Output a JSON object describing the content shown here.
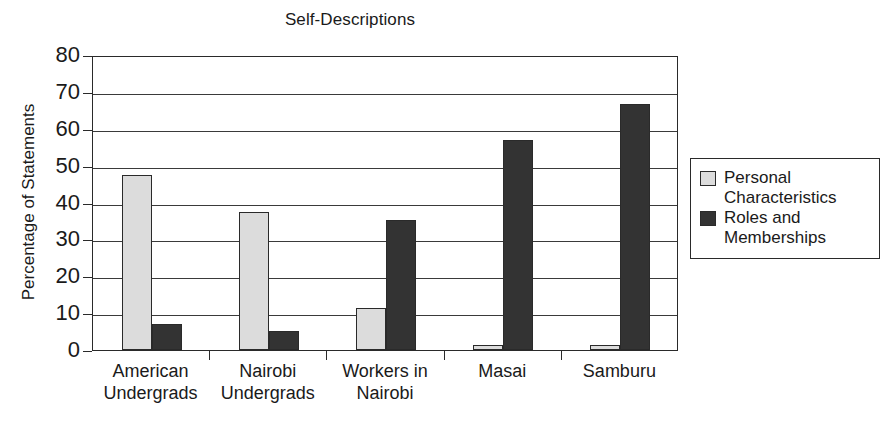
{
  "chart_data": {
    "type": "bar",
    "title": "Self-Descriptions",
    "xlabel": "",
    "ylabel": "Percentage of Statements",
    "ylim": [
      0,
      80
    ],
    "ytick_step": 10,
    "yticks": [
      80,
      70,
      60,
      50,
      40,
      30,
      20,
      10,
      0
    ],
    "grid": true,
    "legend_position": "right",
    "categories": [
      "American Undergrads",
      "Nairobi Undergrads",
      "Workers in Nairobi",
      "Masai",
      "Samburu"
    ],
    "category_lines": [
      [
        "American",
        "Undergrads"
      ],
      [
        "Nairobi",
        "Undergrads"
      ],
      [
        "Workers in",
        "Nairobi"
      ],
      [
        "Masai",
        ""
      ],
      [
        "Samburu",
        ""
      ]
    ],
    "series": [
      {
        "name": "Personal Characteristics",
        "color": "#dcdcdc",
        "values": [
          47.5,
          37.3,
          11.5,
          1.3,
          0.6
        ]
      },
      {
        "name": "Roles and Memberships",
        "color": "#333333",
        "values": [
          7.0,
          5.2,
          35.3,
          57.0,
          66.7
        ]
      }
    ]
  },
  "legend": {
    "items": [
      {
        "label_line1": "Personal",
        "label_line2": "Characteristics",
        "swatch": "personal"
      },
      {
        "label_line1": "Roles and",
        "label_line2": "Memberships",
        "swatch": "roles"
      }
    ]
  },
  "colors": {
    "personal": "#dcdcdc",
    "roles": "#333333",
    "axis": "#2a2a2a",
    "background": "#ffffff"
  }
}
